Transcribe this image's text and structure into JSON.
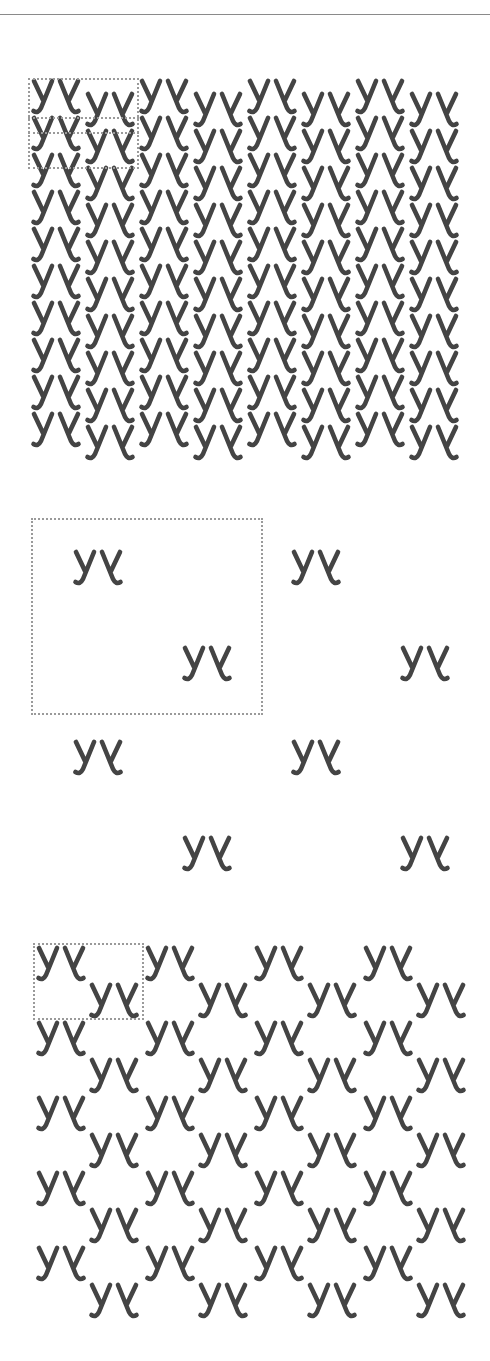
{
  "figure": {
    "motif": {
      "label": "yy-mirrored",
      "description": "letter y followed by its horizontal mirror image",
      "width": 52,
      "height": 38,
      "stroke_color": "#444444",
      "stroke_width": 4.6
    },
    "tile_outline_color": "#9a9a9a",
    "top_rule_color": "#8a8a8a",
    "panels": [
      {
        "name": "dense-pattern",
        "origin": [
          30,
          78
        ],
        "col_pitch": 54,
        "row_pitch": 37,
        "cols": 8,
        "rows": 10,
        "odd_col_dy": 13,
        "tile": {
          "x": 28,
          "y": 78,
          "w": 111,
          "h": 91,
          "inner_lines_y": [
            117,
            132
          ]
        }
      },
      {
        "name": "sparse-pattern",
        "origin": [
          72,
          549
        ],
        "col_pitch": 218,
        "row_pitch": 190,
        "cols": 2,
        "rows": 2,
        "second_offset": [
          109,
          96
        ],
        "tile": {
          "x": 31,
          "y": 518,
          "w": 232,
          "h": 197
        }
      },
      {
        "name": "staggered-pattern",
        "origin": [
          35,
          945
        ],
        "col_pitch": 109,
        "row_pitch": 75,
        "cols": 4,
        "rows": 5,
        "second_offset": [
          53,
          37
        ],
        "tile": {
          "x": 33,
          "y": 943,
          "w": 111,
          "h": 77
        }
      }
    ]
  }
}
